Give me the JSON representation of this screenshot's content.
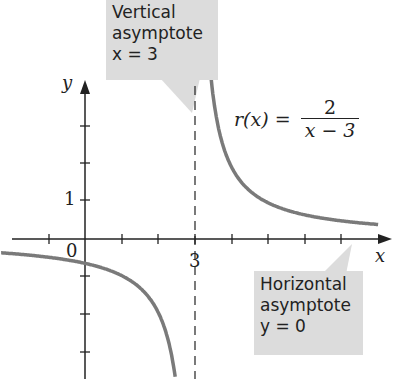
{
  "chart_data": {
    "type": "line",
    "title": "",
    "function": "r(x) = 2/(x - 3)",
    "xlabel": "x",
    "ylabel": "y",
    "x_tick_labels": [
      "0",
      "3"
    ],
    "y_tick_labels": [
      "1"
    ],
    "xlim": [
      -2.3,
      8.6
    ],
    "ylim": [
      -3.8,
      6.5
    ],
    "grid": false,
    "series": [
      {
        "name": "r(x) left branch",
        "x": [
          -2.3,
          -1,
          0,
          1,
          2,
          2.5
        ],
        "y": [
          -0.38,
          -0.5,
          -0.667,
          -1,
          -2,
          -4
        ]
      },
      {
        "name": "r(x) right branch",
        "x": [
          3.4,
          3.5,
          4,
          5,
          6,
          7,
          8
        ],
        "y": [
          5,
          4,
          2,
          1,
          0.667,
          0.5,
          0.4
        ]
      }
    ],
    "asymptotes": {
      "vertical": 3,
      "horizontal": 0
    },
    "annotations": [
      {
        "text": "Vertical asymptote x = 3"
      },
      {
        "text": "Horizontal asymptote y = 0"
      },
      {
        "text": "r(x) = 2/(x - 3)"
      }
    ]
  },
  "labels": {
    "y_axis": "y",
    "x_axis": "x",
    "origin": "0",
    "x_three": "3",
    "y_one": "1",
    "formula_lhs": "r(x) =",
    "formula_num": "2",
    "formula_den": "x − 3",
    "vertical_callout": [
      "Vertical",
      "asymptote",
      "x = 3"
    ],
    "horizontal_callout": [
      "Horizontal",
      "asymptote",
      "y = 0"
    ]
  },
  "colors": {
    "curve": "#7a7a7a",
    "axis": "#222222",
    "callout": "#dcdcdc"
  }
}
